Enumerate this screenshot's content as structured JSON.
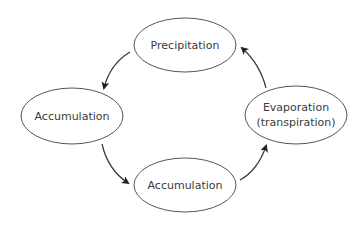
{
  "diagram": {
    "type": "cycle",
    "title": "",
    "colors": {
      "background": "#ffffff",
      "node_stroke": "#555555",
      "node_fill": "#ffffff",
      "text": "#3a3a3a",
      "edge": "#333333"
    },
    "nodes": [
      {
        "id": "precipitation",
        "label": "Precipitation",
        "lines": [
          "Precipitation"
        ],
        "cx": 185,
        "cy": 45,
        "rx": 51,
        "ry": 27
      },
      {
        "id": "accumulation_left",
        "label": "Accumulation",
        "lines": [
          "Accumulation"
        ],
        "cx": 72,
        "cy": 116,
        "rx": 51,
        "ry": 28
      },
      {
        "id": "accumulation_bottom",
        "label": "Accumulation",
        "lines": [
          "Accumulation"
        ],
        "cx": 185,
        "cy": 185,
        "rx": 51,
        "ry": 27
      },
      {
        "id": "evaporation",
        "label": "Evaporation (transpiration)",
        "lines": [
          "Evaporation",
          "(transpiration)"
        ],
        "cx": 296,
        "cy": 115,
        "rx": 51,
        "ry": 29
      }
    ],
    "edges": [
      {
        "from": "precipitation",
        "to": "accumulation_left",
        "path": "M130,52 Q110,64 104,88"
      },
      {
        "from": "accumulation_left",
        "to": "accumulation_bottom",
        "path": "M102,144 Q108,170 128,183"
      },
      {
        "from": "accumulation_bottom",
        "to": "evaporation",
        "path": "M240,180 Q258,170 266,146"
      },
      {
        "from": "evaporation",
        "to": "precipitation",
        "path": "M266,88 Q260,64 242,48"
      }
    ]
  }
}
